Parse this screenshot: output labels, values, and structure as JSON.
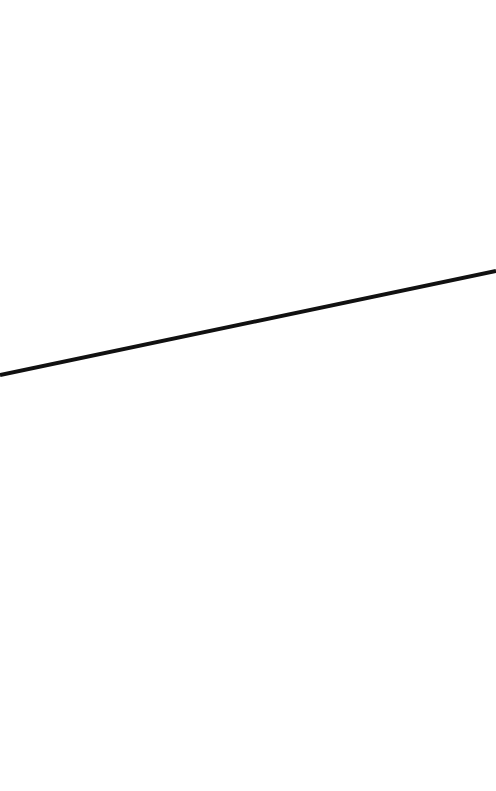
{
  "canvas": {
    "background_color": "#ffffff"
  },
  "stroke": {
    "shape": "straight-line",
    "color": "#111111",
    "direction": "rising left-to-right"
  }
}
